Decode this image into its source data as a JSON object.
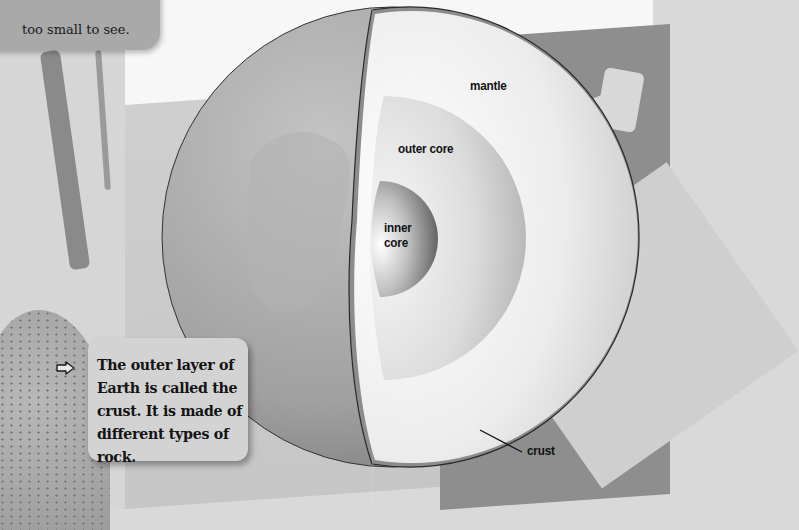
{
  "page": {
    "top_callout_text": "too small to see.",
    "info_box": {
      "icon": "arrow-right-icon",
      "text": "The outer layer of Earth is called the crust. It is made of different types of rock."
    }
  },
  "diagram": {
    "labels": {
      "mantle": "mantle",
      "outer_core": "outer core",
      "inner_core_line1": "inner",
      "inner_core_line2": "core",
      "crust": "crust"
    },
    "colors": {
      "globe_surface": "#9d9d9d",
      "crust": "#7a7a7a",
      "mantle": "#e9e9e9",
      "outer_core": "#d4d4d4",
      "inner_core": "#8f8f8f"
    }
  }
}
